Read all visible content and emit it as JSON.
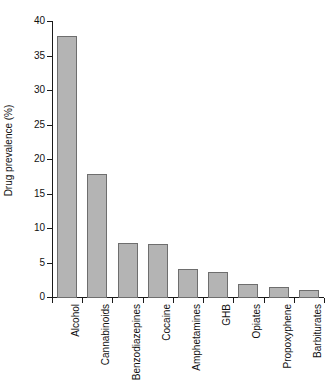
{
  "chart_data": {
    "type": "bar",
    "title": "",
    "xlabel": "",
    "ylabel": "Drug prevalence (%)",
    "categories": [
      "Alcohol",
      "Cannabinoids",
      "Benzodiazepines",
      "Cocaine",
      "Amphetamines",
      "GHB",
      "Opiates",
      "Propoxyphene",
      "Barbiturates"
    ],
    "values": [
      38.0,
      17.9,
      7.9,
      7.8,
      4.2,
      3.8,
      2.1,
      1.6,
      1.1
    ],
    "ylim": [
      0,
      40
    ],
    "yticks": [
      0,
      5,
      10,
      15,
      20,
      25,
      30,
      35,
      40
    ],
    "ytick_labels": [
      "0",
      "5",
      "10",
      "15",
      "20",
      "25",
      "30",
      "35",
      "40"
    ],
    "grid": false,
    "legend": null,
    "bar_color": "#b4b4b4",
    "bar_edge_color": "#6e6e6e",
    "axis_color": "#1a1a1a",
    "background": "#ffffff"
  }
}
